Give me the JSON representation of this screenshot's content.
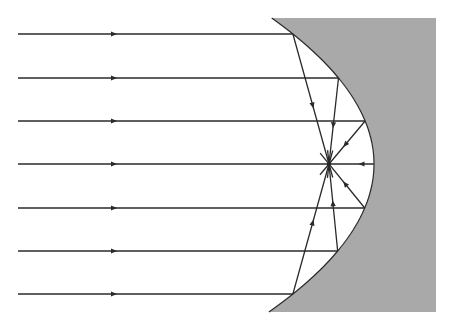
{
  "diagram": {
    "type": "parabolic-mirror-reflection",
    "colors": {
      "mirror": "#a9a9a9",
      "ray": "#2a2a2a",
      "background": "#ffffff"
    },
    "mirror": {
      "vertex": [
        374,
        164
      ],
      "k": 0.0048,
      "y_top": 18,
      "y_bottom": 312,
      "x_right": 436
    },
    "focus": [
      329,
      164
    ],
    "ray_start_x": 18,
    "incident_arrow_x": 114,
    "ray_ys": [
      34,
      78,
      121,
      164,
      208,
      251,
      294
    ]
  }
}
